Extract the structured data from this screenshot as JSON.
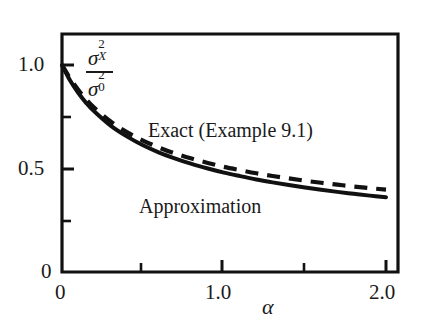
{
  "chart_data": {
    "type": "line",
    "title": "",
    "xlabel": "α",
    "ylabel": "σ²_X / σ²_0",
    "xlim": [
      0,
      2.0
    ],
    "ylim": [
      0,
      1.125
    ],
    "grid": false,
    "legend_position": "inline-annotations",
    "x_ticks_labeled": [
      "0",
      "1.0",
      "2.0"
    ],
    "x_tick_values_labeled": [
      0,
      1.0,
      2.0
    ],
    "x_minor_tick_values": [
      0.5,
      1.5
    ],
    "y_ticks_labeled": [
      "0",
      "0.5",
      "1.0"
    ],
    "y_tick_values_labeled": [
      0,
      0.5,
      1.0
    ],
    "y_minor_tick_values": [
      0.25,
      0.75
    ],
    "series": [
      {
        "name": "Exact (Example 9.1)",
        "style": "dashed",
        "color": "#111111",
        "x": [
          0,
          0.05,
          0.1,
          0.15,
          0.2,
          0.3,
          0.4,
          0.5,
          0.6,
          0.7,
          0.8,
          0.9,
          1.0,
          1.1,
          1.2,
          1.3,
          1.4,
          1.5,
          1.6,
          1.7,
          1.8,
          1.9,
          2.0
        ],
        "values": [
          1.0,
          0.935,
          0.88,
          0.833,
          0.793,
          0.727,
          0.676,
          0.635,
          0.601,
          0.572,
          0.548,
          0.527,
          0.508,
          0.492,
          0.477,
          0.464,
          0.452,
          0.441,
          0.431,
          0.422,
          0.413,
          0.405,
          0.398
        ]
      },
      {
        "name": "Approximation",
        "style": "solid",
        "color": "#111111",
        "x": [
          0,
          0.05,
          0.1,
          0.15,
          0.2,
          0.3,
          0.4,
          0.5,
          0.6,
          0.7,
          0.8,
          0.9,
          1.0,
          1.1,
          1.2,
          1.3,
          1.4,
          1.5,
          1.6,
          1.7,
          1.8,
          1.9,
          2.0
        ],
        "values": [
          1.0,
          0.925,
          0.866,
          0.816,
          0.775,
          0.707,
          0.655,
          0.612,
          0.577,
          0.548,
          0.522,
          0.5,
          0.48,
          0.463,
          0.447,
          0.433,
          0.42,
          0.408,
          0.397,
          0.387,
          0.378,
          0.369,
          0.361
        ]
      }
    ],
    "annotations": [
      {
        "text": "Exact (Example 9.1)",
        "x": 0.75,
        "y": 0.62
      },
      {
        "text": "Approximation",
        "x": 0.62,
        "y": 0.27
      }
    ]
  },
  "axes": {
    "x_tick_labels": [
      {
        "text": "0",
        "value": 0
      },
      {
        "text": "1.0",
        "value": 1.0
      },
      {
        "text": "2.0",
        "value": 2.0
      }
    ],
    "y_tick_labels": [
      {
        "text": "1.0",
        "value": 1.0
      },
      {
        "text": "0.5",
        "value": 0.5
      },
      {
        "text": "0",
        "value": 0
      }
    ],
    "x_axis_title": "α",
    "y_axis_label": {
      "numerator_symbol": "σ",
      "numerator_superscript": "2",
      "numerator_subscript": "X",
      "denominator_symbol": "σ",
      "denominator_superscript": "2",
      "denominator_subscript": "0"
    }
  },
  "labels": {
    "exact": "Exact (Example 9.1)",
    "approximation": "Approximation"
  },
  "colors": {
    "ink": "#111111",
    "background": "#ffffff"
  }
}
